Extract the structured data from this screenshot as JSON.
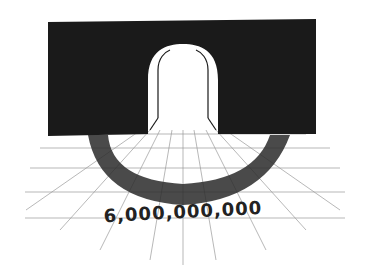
{
  "illustration": {
    "description": "Hand-drawn illustration of a dark wall with an arched doorway; a crowd of tiny people streams out onto a perspective grid floor",
    "caption": "6,000,000,000",
    "colors": {
      "wall": "#1a1a1a",
      "background": "#ffffff",
      "grid": "#9a9a9a",
      "crowd": "#2a2a2a"
    }
  }
}
